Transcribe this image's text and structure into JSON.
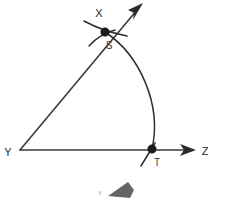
{
  "figure": {
    "background_color": "#ffffff",
    "line_color": "#3b3b3b",
    "point_color": "#1a1a1a",
    "label_color": "#2b2b2b",
    "width": 225,
    "height": 198
  },
  "labels": {
    "vertex_y": "Y",
    "ray_x_end": "X",
    "ray_z_end": "Z",
    "point_s": "S",
    "point_t": "T",
    "partial_bottom": "V"
  },
  "geometry": {
    "vertex": {
      "name": "Y",
      "x": 20,
      "y": 150
    },
    "points": [
      {
        "name": "S",
        "x": 105,
        "y": 32,
        "on_ray": "YX",
        "marked": true
      },
      {
        "name": "T",
        "x": 152,
        "y": 149,
        "on_ray": "YZ",
        "marked": true
      }
    ],
    "rays": [
      {
        "name": "YX",
        "from_x": 20,
        "from_y": 150,
        "to_x": 142,
        "to_y": 4,
        "label": "X",
        "arrowhead": true
      },
      {
        "name": "YZ",
        "from_x": 20,
        "from_y": 150,
        "to_x": 196,
        "to_y": 150,
        "label": "Z",
        "arrowhead": true
      }
    ],
    "arc": {
      "name": "arc-S-to-T",
      "from_x": 105,
      "from_y": 32,
      "to_x": 152,
      "to_y": 149,
      "bulge_direction": "right",
      "max_x": 160
    }
  },
  "label_positions": {
    "X": {
      "x": 99,
      "y": 17
    },
    "Y": {
      "x": 8,
      "y": 156
    },
    "Z": {
      "x": 203,
      "y": 155
    },
    "S": {
      "x": 108,
      "y": 48
    },
    "T": {
      "x": 156,
      "y": 166
    },
    "V": {
      "x": 95,
      "y": 193
    }
  }
}
